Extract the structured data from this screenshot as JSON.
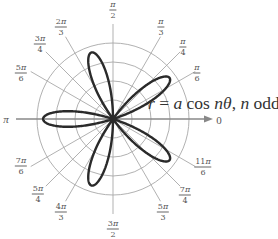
{
  "chart_data": {
    "type": "polar",
    "title": "",
    "equation": {
      "prefix_var": "r",
      "eq": " = ",
      "coef": "a",
      "func": " cos ",
      "arg_n": "n",
      "arg_theta": "θ",
      "sep": ", ",
      "cond_n": "n",
      "cond_text": " odd"
    },
    "curve": {
      "formula": "r = a cos nθ (rose, n odd)",
      "n": 5,
      "petal_count": 5,
      "petal_angles_deg": [
        36,
        108,
        180,
        252,
        324
      ],
      "petal_length_fraction_of_outer": 0.92
    },
    "grid": {
      "circle_count": 4,
      "radial_lines_deg": [
        0,
        30,
        45,
        60,
        90,
        120,
        135,
        150,
        180,
        210,
        225,
        240,
        270,
        300,
        315,
        330
      ]
    },
    "axis_zero_label": "0",
    "angle_labels": [
      {
        "key": "pi_2",
        "num": "π",
        "num_coef": "",
        "den": "2",
        "x": 113,
        "y": 10
      },
      {
        "key": "pi_3",
        "num": "π",
        "num_coef": "",
        "den": "3",
        "x": 161,
        "y": 27
      },
      {
        "key": "pi_4",
        "num": "π",
        "num_coef": "",
        "den": "4",
        "x": 183,
        "y": 47
      },
      {
        "key": "pi_6",
        "num": "π",
        "num_coef": "",
        "den": "6",
        "x": 197,
        "y": 73
      },
      {
        "key": "2pi_3",
        "num": "π",
        "num_coef": "2",
        "den": "3",
        "x": 61,
        "y": 27
      },
      {
        "key": "3pi_4",
        "num": "π",
        "num_coef": "3",
        "den": "4",
        "x": 40,
        "y": 44
      },
      {
        "key": "5pi_6",
        "num": "π",
        "num_coef": "5",
        "den": "6",
        "x": 21,
        "y": 73
      },
      {
        "key": "7pi_6",
        "num": "π",
        "num_coef": "7",
        "den": "6",
        "x": 21,
        "y": 166
      },
      {
        "key": "5pi_4",
        "num": "π",
        "num_coef": "5",
        "den": "4",
        "x": 38,
        "y": 194
      },
      {
        "key": "4pi_3",
        "num": "π",
        "num_coef": "4",
        "den": "3",
        "x": 61,
        "y": 212
      },
      {
        "key": "3pi_2",
        "num": "π",
        "num_coef": "3",
        "den": "2",
        "x": 113,
        "y": 229
      },
      {
        "key": "5pi_3",
        "num": "π",
        "num_coef": "5",
        "den": "3",
        "x": 163,
        "y": 212
      },
      {
        "key": "7pi_4",
        "num": "π",
        "num_coef": "7",
        "den": "4",
        "x": 185,
        "y": 195
      },
      {
        "key": "11pi_6",
        "num": "π",
        "num_coef": "11",
        "den": "6",
        "x": 203,
        "y": 167
      }
    ],
    "pi_label": {
      "text": "π",
      "x": 6,
      "y": 119
    },
    "zero_label": {
      "text": "0",
      "x": 219,
      "y": 120
    },
    "layout": {
      "center_x": 113,
      "center_y": 119,
      "circle_spacing": 19,
      "radial_extent": 95,
      "axis_arrow_end_x": 213,
      "colors": {
        "grid": "#a8a8a8",
        "axis": "#888888",
        "curve": "#2a2a2a",
        "text": "#555555"
      }
    }
  }
}
